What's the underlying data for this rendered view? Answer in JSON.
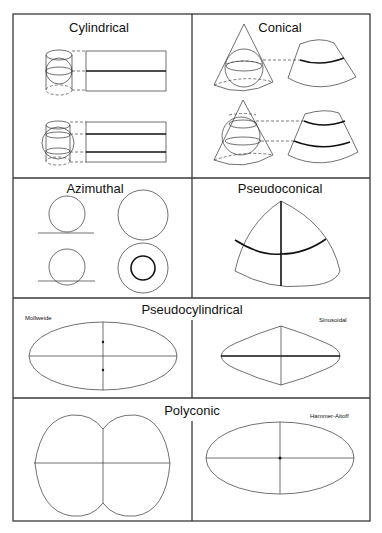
{
  "panels": {
    "cylindrical": {
      "title": "Cylindrical"
    },
    "conical": {
      "title": "Conical"
    },
    "azimuthal": {
      "title": "Azimuthal"
    },
    "pseudoconical": {
      "title": "Pseudoconical"
    },
    "pseudocylindrical": {
      "title": "Pseudocylindrical",
      "left_label": "Mollweide",
      "right_label": "Sinusoidal"
    },
    "polyconic": {
      "title": "Polyconic",
      "right_label": "Hammer-Aitoff"
    }
  },
  "colors": {
    "line": "#333333",
    "background": "#ffffff"
  }
}
